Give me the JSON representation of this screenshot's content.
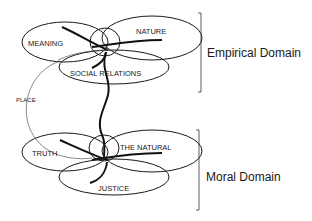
{
  "diagram": {
    "empirical": {
      "domain_label": "Empirical Domain",
      "circles": {
        "meaning": "MEANING",
        "nature": "NATURE",
        "social_relations": "SOCIAL RELATIONS"
      }
    },
    "moral": {
      "domain_label": "Moral Domain",
      "circles": {
        "truth": "TRUTH",
        "the_natural": "THE NATURAL",
        "justice": "JUSTICE"
      }
    },
    "connector_label": "PLACE",
    "colors": {
      "line": "#1a1a1a",
      "thin_line": "#555555",
      "background": "#ffffff"
    }
  }
}
